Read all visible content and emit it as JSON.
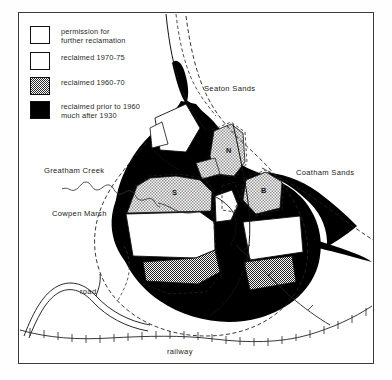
{
  "figure": {
    "type": "thematic-map",
    "background": "#ffffff",
    "frame_color": "#3a3a3a"
  },
  "legend": {
    "items": [
      {
        "swatch": "light-stipple",
        "label": "permission for\nfurther reclamation",
        "fill": "#9a9a9a"
      },
      {
        "swatch": "white",
        "label": "reclaimed 1970-75",
        "fill": "#ffffff"
      },
      {
        "swatch": "checker-stipple",
        "label": "reclaimed 1960-70",
        "fill": "#2b2b2b"
      },
      {
        "swatch": "solid-black",
        "label": "reclaimed prior to 1960\nmuch after 1930",
        "fill": "#000000"
      }
    ]
  },
  "map_labels": {
    "seaton_sands": "Seaton Sands",
    "coatham_sands": "Coatham Sands",
    "greatham_creek": "Greatham Creek",
    "cowpen_marsh": "Cowpen Marsh",
    "road": "road",
    "railway": "railway"
  },
  "plot_markers": {
    "n": "N",
    "s": "S",
    "b": "B"
  }
}
